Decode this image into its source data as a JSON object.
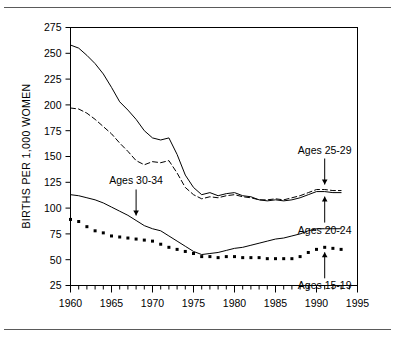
{
  "chart_data": {
    "type": "line",
    "title": "",
    "subtitle": "",
    "xlabel": "",
    "ylabel": "BIRTHS PER 1,000 WOMEN",
    "xlim": [
      1960,
      1995
    ],
    "ylim": [
      25,
      275
    ],
    "xticks": [
      1960,
      1965,
      1970,
      1975,
      1980,
      1985,
      1990,
      1995
    ],
    "xtick_labels": [
      "1960",
      "1965",
      "1970",
      "1975",
      "1980",
      "1985",
      "1990",
      "1995"
    ],
    "xminor_step": 1,
    "yticks": [
      25,
      50,
      75,
      100,
      125,
      150,
      175,
      200,
      225,
      250,
      275
    ],
    "ytick_labels": [
      "25",
      "50",
      "75",
      "100",
      "125",
      "150",
      "175",
      "200",
      "225",
      "250",
      "275"
    ],
    "grid": false,
    "legend_position": "inline-annotations",
    "x": [
      1960,
      1961,
      1962,
      1963,
      1964,
      1965,
      1966,
      1967,
      1968,
      1969,
      1970,
      1971,
      1972,
      1973,
      1974,
      1975,
      1976,
      1977,
      1978,
      1979,
      1980,
      1981,
      1982,
      1983,
      1984,
      1985,
      1986,
      1987,
      1988,
      1989,
      1990,
      1991,
      1992,
      1993
    ],
    "series": [
      {
        "name": "Ages 20-24",
        "style": "solid",
        "color": "#000000",
        "values": [
          258,
          255,
          248,
          240,
          230,
          217,
          203,
          195,
          186,
          175,
          168,
          166,
          168,
          152,
          132,
          120,
          113,
          115,
          112,
          114,
          115,
          112,
          111,
          108,
          107,
          108,
          107,
          108,
          110,
          113,
          116,
          116,
          115,
          115
        ]
      },
      {
        "name": "Ages 25-29",
        "style": "dashed",
        "color": "#000000",
        "values": [
          197,
          196,
          192,
          186,
          179,
          172,
          163,
          155,
          146,
          142,
          145,
          144,
          146,
          134,
          120,
          113,
          109,
          111,
          110,
          112,
          113,
          111,
          110,
          108,
          108,
          109,
          108,
          110,
          112,
          115,
          118,
          118,
          117,
          117
        ]
      },
      {
        "name": "Ages 30-34",
        "style": "solid",
        "color": "#000000",
        "values": [
          113,
          112,
          110,
          108,
          105,
          101,
          97,
          93,
          88,
          83,
          80,
          78,
          73,
          68,
          63,
          58,
          55,
          56,
          57,
          59,
          61,
          62,
          64,
          66,
          68,
          70,
          71,
          73,
          75,
          78,
          80,
          80,
          80,
          80
        ]
      },
      {
        "name": "Ages 15-19",
        "style": "dotted",
        "color": "#000000",
        "values": [
          89,
          87,
          82,
          78,
          76,
          73,
          72,
          71,
          70,
          69,
          68,
          65,
          62,
          60,
          58,
          56,
          53,
          53,
          52,
          53,
          53,
          52,
          52,
          52,
          51,
          51,
          51,
          51,
          53,
          57,
          60,
          62,
          61,
          60
        ]
      }
    ],
    "annotations": [
      {
        "text": "Ages 25-29",
        "target_year": 1991,
        "target_value": 118,
        "direction": "down"
      },
      {
        "text": "Ages 20-24",
        "target_year": 1991,
        "target_value": 116,
        "direction": "up"
      },
      {
        "text": "Ages 30-34",
        "target_year": 1968,
        "target_value": 88,
        "direction": "down"
      },
      {
        "text": "Ages 15-19",
        "target_year": 1991,
        "target_value": 62,
        "direction": "up"
      }
    ]
  }
}
